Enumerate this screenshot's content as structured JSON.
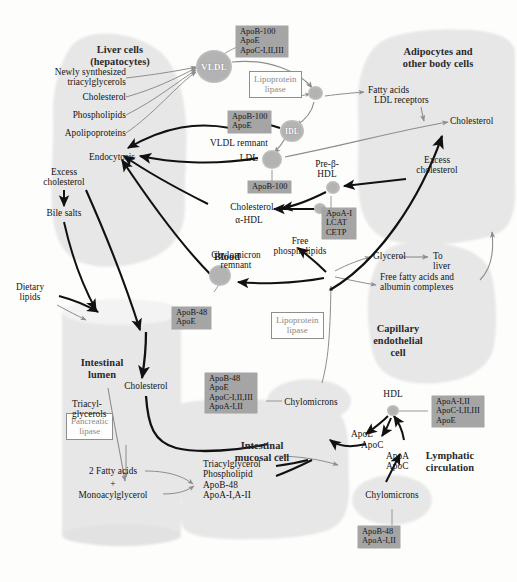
{
  "figure": {
    "colors": {
      "cell_fill": "#e6e6e6",
      "apo_box_fill": "#a5a5a5",
      "node_fill": "#b3b3b3",
      "arrow_dark": "#111111",
      "arrow_gray": "#8d8d8d",
      "text": "#141414"
    }
  },
  "regions": [
    {
      "key": "liver",
      "label": "Liver cells\n(hepatocytes)"
    },
    {
      "key": "adipocyte",
      "label": "Adipocytes and\nother body cells"
    },
    {
      "key": "blood",
      "label": "Blood"
    },
    {
      "key": "capillary",
      "label": "Capillary\nendothelial\ncell"
    },
    {
      "key": "lumen",
      "label": "Intestinal\nlumen"
    },
    {
      "key": "mucosal",
      "label": "Intestinal\nmucosal cell"
    },
    {
      "key": "lymph",
      "label": "Lymphatic\ncirculation"
    }
  ],
  "nodes": [
    {
      "key": "vldl",
      "label": "VLDL"
    },
    {
      "key": "idl",
      "label": "IDL"
    },
    {
      "key": "ldl",
      "label": ""
    },
    {
      "key": "vldl_rem",
      "label": ""
    },
    {
      "key": "cap_lp",
      "label": ""
    },
    {
      "key": "prebhdl",
      "label": ""
    },
    {
      "key": "ahdl",
      "label": ""
    },
    {
      "key": "chylo_rem",
      "label": ""
    },
    {
      "key": "hdl",
      "label": ""
    }
  ],
  "apo_boxes": [
    {
      "key": "vldl_apo",
      "text": "ApoB-100\nApoE\nApoC-I,II,III"
    },
    {
      "key": "vldl_rem_apo",
      "text": "ApoB-100\nApoE"
    },
    {
      "key": "ldl_apo",
      "text": "ApoB-100"
    },
    {
      "key": "hdl_apo",
      "text": "ApoA-I\nLCAT\nCETP"
    },
    {
      "key": "chylo_rem_apo",
      "text": "ApoB-48\nApoE"
    },
    {
      "key": "chylo_apo",
      "text": "ApoB-48\nApoE\nApoC-I,II,III\nApoA-I,II"
    },
    {
      "key": "lymph_hdl_apo",
      "text": "ApoA-I,II\nApoC-I,II,III\nApoE"
    },
    {
      "key": "nascent_apo",
      "text": "ApoB-48\nApoA-I,II"
    }
  ],
  "enzyme_boxes": [
    {
      "key": "lpl_top",
      "text": "Lipoprotein\nlipase"
    },
    {
      "key": "lpl_mid",
      "text": "Lipoprotein\nlipase"
    },
    {
      "key": "panc_lip",
      "text": "Pancreatic\nlipase"
    }
  ],
  "labels": [
    {
      "key": "newly_synth_tag",
      "text": "Newly synthesized\ntriacylglycerols"
    },
    {
      "key": "cholesterol_liver",
      "text": "Cholesterol"
    },
    {
      "key": "phospholipids_liver",
      "text": "Phospholipids"
    },
    {
      "key": "apolipoproteins_liver",
      "text": "Apolipoproteins"
    },
    {
      "key": "endocytosis",
      "text": "Endocytosis"
    },
    {
      "key": "excess_chol_liver",
      "text": "Excess\ncholesterol"
    },
    {
      "key": "bile_salts",
      "text": "Bile salts"
    },
    {
      "key": "dietary_lipids",
      "text": "Dietary\nlipids"
    },
    {
      "key": "vldl_remnant",
      "text": "VLDL remnant"
    },
    {
      "key": "ldl_label",
      "text": "LDL"
    },
    {
      "key": "fatty_acids",
      "text": "Fatty acids"
    },
    {
      "key": "ldl_receptors",
      "text": "LDL receptors"
    },
    {
      "key": "cholesterol_adipo",
      "text": "Cholesterol"
    },
    {
      "key": "excess_chol_adipo",
      "text": "Excess\ncholesterol"
    },
    {
      "key": "prebeta_hdl",
      "text": "Pre-β-\nHDL"
    },
    {
      "key": "alpha_hdl",
      "text": "α-HDL"
    },
    {
      "key": "cholesterol_blood",
      "text": "Cholesterol"
    },
    {
      "key": "free_phospholipids",
      "text": "Free\nphospholipids"
    },
    {
      "key": "chylomicron_remnant",
      "text": "Chylomicron\nremnant"
    },
    {
      "key": "glycerol",
      "text": "Glycerol"
    },
    {
      "key": "to_liver",
      "text": "To\nliver"
    },
    {
      "key": "ffa_albumin",
      "text": "Free fatty acids and\nalbumin complexes"
    },
    {
      "key": "chylomicrons_cap",
      "text": "Chylomicrons"
    },
    {
      "key": "hdl_label",
      "text": "HDL"
    },
    {
      "key": "apoe_transfer",
      "text": "ApoE"
    },
    {
      "key": "apoc_transfer",
      "text": "ApoC"
    },
    {
      "key": "apoa_back",
      "text": "ApoA"
    },
    {
      "key": "apoc_back",
      "text": "ApoC"
    },
    {
      "key": "cholesterol_lumen",
      "text": "Cholesterol"
    },
    {
      "key": "triacylglycerols_lumen",
      "text": "Triacyl-\nglycerols"
    },
    {
      "key": "two_fatty_acids",
      "text": "2 Fatty acids"
    },
    {
      "key": "plus_sign",
      "text": "+"
    },
    {
      "key": "monoacylglycerol",
      "text": "Monoacylglycerol"
    },
    {
      "key": "mucosal_products",
      "text": "Triacylglycerol\nPhospholipid\nApoB-48\nApoA-I,A-II"
    },
    {
      "key": "chylomicrons_lymph",
      "text": "Chylomicrons"
    }
  ]
}
